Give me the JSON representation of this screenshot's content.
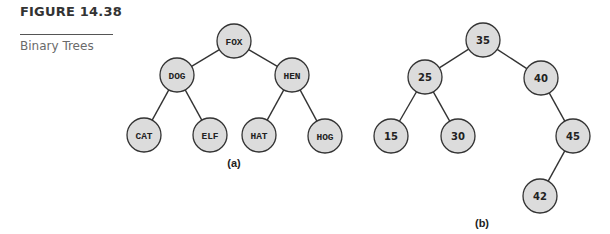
{
  "figure": {
    "number_label": "FIGURE 14.38",
    "caption": "Binary Trees"
  },
  "colors": {
    "node_fill": "#dcdcdc",
    "node_stroke": "#333333",
    "edge": "#333333"
  },
  "trees": [
    {
      "id": "a",
      "caption": "(a)",
      "caption_pos": [
        234,
        167
      ],
      "label_style": "mono",
      "nodes": [
        {
          "id": "FOX",
          "label": "FOX",
          "x": 234,
          "y": 41
        },
        {
          "id": "DOG",
          "label": "DOG",
          "x": 177,
          "y": 75
        },
        {
          "id": "HEN",
          "label": "HEN",
          "x": 292,
          "y": 75
        },
        {
          "id": "CAT",
          "label": "CAT",
          "x": 144,
          "y": 135
        },
        {
          "id": "ELF",
          "label": "ELF",
          "x": 210,
          "y": 135
        },
        {
          "id": "HAT",
          "label": "HAT",
          "x": 259,
          "y": 135
        },
        {
          "id": "HOG",
          "label": "HOG",
          "x": 325,
          "y": 136
        }
      ],
      "edges": [
        [
          "FOX",
          "DOG"
        ],
        [
          "FOX",
          "HEN"
        ],
        [
          "DOG",
          "CAT"
        ],
        [
          "DOG",
          "ELF"
        ],
        [
          "HEN",
          "HAT"
        ],
        [
          "HEN",
          "HOG"
        ]
      ]
    },
    {
      "id": "b",
      "caption": "(b)",
      "caption_pos": [
        482,
        227
      ],
      "label_style": "sans",
      "nodes": [
        {
          "id": "35",
          "label": "35",
          "x": 483,
          "y": 40
        },
        {
          "id": "25",
          "label": "25",
          "x": 425,
          "y": 77
        },
        {
          "id": "40",
          "label": "40",
          "x": 541,
          "y": 78
        },
        {
          "id": "15",
          "label": "15",
          "x": 391,
          "y": 136
        },
        {
          "id": "30",
          "label": "30",
          "x": 458,
          "y": 136
        },
        {
          "id": "45",
          "label": "45",
          "x": 573,
          "y": 136
        },
        {
          "id": "42",
          "label": "42",
          "x": 540,
          "y": 196
        }
      ],
      "edges": [
        [
          "35",
          "25"
        ],
        [
          "35",
          "40"
        ],
        [
          "25",
          "15"
        ],
        [
          "25",
          "30"
        ],
        [
          "40",
          "45"
        ],
        [
          "45",
          "42"
        ]
      ]
    }
  ],
  "node_radius": 17
}
